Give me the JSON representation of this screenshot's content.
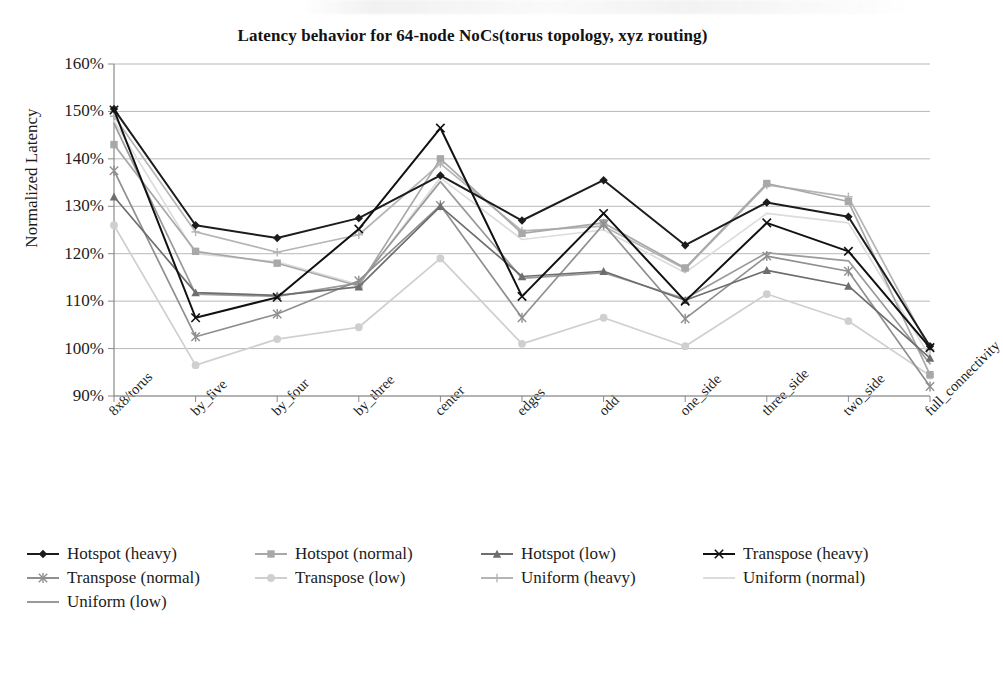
{
  "chart_data": {
    "type": "line",
    "title": "Latency behavior for 64-node NoCs(torus topology, xyz routing)",
    "xlabel": "",
    "ylabel": "Normalized Latency",
    "ylim": [
      90,
      160
    ],
    "ytick_step": 10,
    "ytick_labels": [
      "160%",
      "150%",
      "140%",
      "130%",
      "120%",
      "110%",
      "100%",
      "90%"
    ],
    "ytick_values": [
      160,
      150,
      140,
      130,
      120,
      110,
      100,
      90
    ],
    "grid": true,
    "legend_position": "bottom",
    "value_suffix": "%",
    "categories": [
      "8x8/torus",
      "by_five",
      "by_four",
      "by_three",
      "center",
      "edges",
      "odd",
      "one_side",
      "three_side",
      "two_side",
      "full_connectivity"
    ],
    "series": [
      {
        "name": "Hotspot (heavy)",
        "color": "#1c1c1c",
        "marker": "diamond",
        "values": [
          150.5,
          126.0,
          123.3,
          127.5,
          136.5,
          127.0,
          135.5,
          121.8,
          130.8,
          127.8,
          100.5
        ]
      },
      {
        "name": "Hotspot (normal)",
        "color": "#a8a8a8",
        "marker": "square",
        "values": [
          143.0,
          120.5,
          118.0,
          113.2,
          140.0,
          124.3,
          126.5,
          117.0,
          134.8,
          131.0,
          94.5
        ]
      },
      {
        "name": "Hotspot (low)",
        "color": "#6e6e6e",
        "marker": "triangle",
        "values": [
          132.0,
          111.8,
          111.2,
          113.0,
          130.0,
          115.2,
          116.3,
          110.2,
          116.5,
          113.2,
          98.0
        ]
      },
      {
        "name": "Transpose (heavy)",
        "color": "#111111",
        "marker": "cross",
        "values": [
          150.3,
          106.5,
          110.8,
          125.2,
          146.5,
          111.0,
          128.5,
          110.0,
          126.5,
          120.5,
          100.2
        ]
      },
      {
        "name": "Transpose (normal)",
        "color": "#8f8f8f",
        "marker": "star",
        "values": [
          137.5,
          102.5,
          107.3,
          114.3,
          130.2,
          106.5,
          126.2,
          106.3,
          119.5,
          116.3,
          92.0
        ]
      },
      {
        "name": "Transpose (low)",
        "color": "#cfcfcf",
        "marker": "circle",
        "values": [
          126.0,
          96.5,
          102.0,
          104.5,
          119.0,
          101.0,
          106.5,
          100.5,
          111.5,
          105.8,
          94.3
        ]
      },
      {
        "name": "Uniform (heavy)",
        "color": "#b5b5b5",
        "marker": "plus",
        "values": [
          149.0,
          124.6,
          120.3,
          124.0,
          139.0,
          124.8,
          125.8,
          116.8,
          134.5,
          132.0,
          99.8
        ]
      },
      {
        "name": "Uniform (normal)",
        "color": "#dcdcdc",
        "marker": "none",
        "values": [
          148.0,
          120.0,
          118.3,
          113.5,
          136.0,
          123.0,
          125.0,
          116.0,
          128.5,
          126.5,
          98.3
        ]
      },
      {
        "name": "Uniform (low)",
        "color": "#9a9a9a",
        "marker": "none",
        "values": [
          147.5,
          111.5,
          111.0,
          113.8,
          135.2,
          114.8,
          116.0,
          110.5,
          120.2,
          118.5,
          96.8
        ]
      }
    ]
  },
  "axis": {
    "y_label": "Normalized Latency"
  }
}
